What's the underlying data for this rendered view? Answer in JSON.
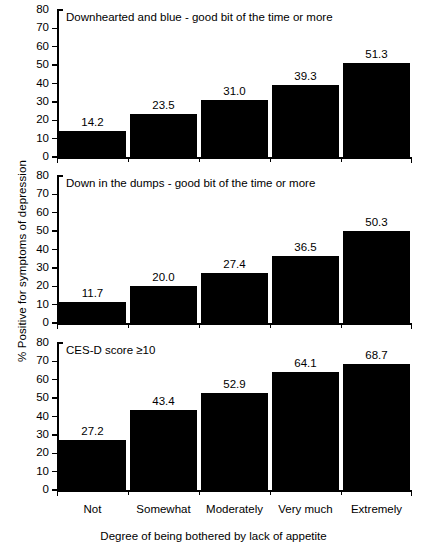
{
  "chart_data": {
    "type": "bar",
    "title": "",
    "xlabel": "Degree of being bothered by lack of appetite",
    "ylabel": "% Positive for symptoms of depression",
    "ylim": [
      0,
      80
    ],
    "yticks": [
      0,
      10,
      20,
      30,
      40,
      50,
      60,
      70,
      80
    ],
    "ytick_labels": [
      "0",
      "10",
      "20",
      "30",
      "40",
      "50",
      "60",
      "70",
      "80"
    ],
    "grid": false,
    "legend": "none",
    "bar_color": "#000000",
    "categories": [
      "Not",
      "Somewhat",
      "Moderately",
      "Very much",
      "Extremely"
    ],
    "panels": [
      {
        "title": "Downhearted and blue - good bit of the time or more",
        "values": [
          14.2,
          23.5,
          31.0,
          39.3,
          51.3
        ],
        "value_labels": [
          "14.2",
          "23.5",
          "31.0",
          "39.3",
          "51.3"
        ]
      },
      {
        "title": "Down in the dumps - good bit of the time or more",
        "values": [
          11.7,
          20.0,
          27.4,
          36.5,
          50.3
        ],
        "value_labels": [
          "11.7",
          "20.0",
          "27.4",
          "36.5",
          "50.3"
        ]
      },
      {
        "title": "CES-D score ≥10",
        "values": [
          27.2,
          43.4,
          52.9,
          64.1,
          68.7
        ],
        "value_labels": [
          "27.2",
          "43.4",
          "52.9",
          "64.1",
          "68.7"
        ]
      }
    ]
  }
}
